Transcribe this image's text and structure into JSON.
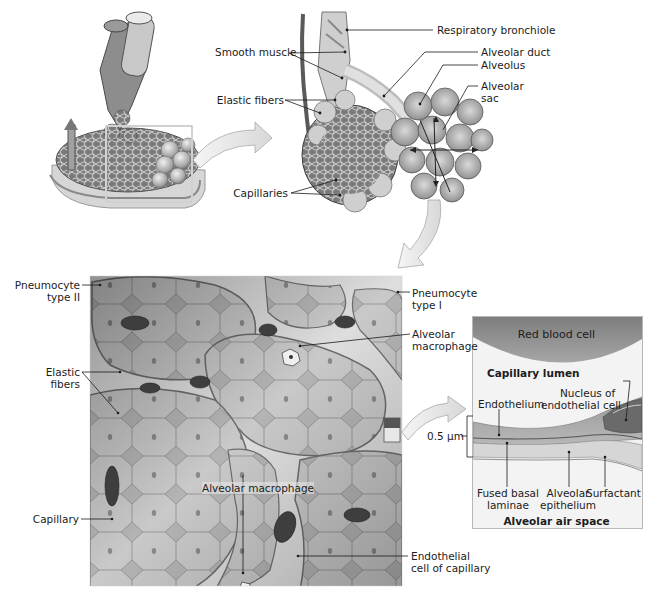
{
  "figure": {
    "topLeft": {
      "name": "lung-lobule-overview",
      "highlightBox": true
    },
    "topRight": {
      "labels": {
        "respiratory_bronchiole": "Respiratory bronchiole",
        "smooth_muscle": "Smooth muscle",
        "alveolar_duct": "Alveolar duct",
        "alveolus": "Alveolus",
        "alveolar_sac_1": "Alveolar",
        "alveolar_sac_2": "sac",
        "elastic_fibers": "Elastic fibers",
        "capillaries": "Capillaries"
      }
    },
    "bottomLeft": {
      "labels": {
        "pneumocyte_ii_1": "Pneumocyte",
        "pneumocyte_ii_2": "type II",
        "pneumocyte_i_1": "Pneumocyte",
        "pneumocyte_i_2": "type I",
        "alveolar_macrophage_1": "Alveolar",
        "alveolar_macrophage_2": "macrophage",
        "elastic_fibers_1": "Elastic",
        "elastic_fibers_2": "fibers",
        "capillary": "Capillary",
        "alveolar_macrophage_inner": "Alveolar macrophage",
        "endothelial_cell_1": "Endothelial",
        "endothelial_cell_2": "cell of capillary"
      }
    },
    "rightPanel": {
      "labels": {
        "red_blood_cell": "Red blood cell",
        "capillary_lumen": "Capillary lumen",
        "nucleus_1": "Nucleus of",
        "nucleus_2": "endothelial cell",
        "endothelium": "Endothelium",
        "scale": "0.5 μm",
        "fused_basal_1": "Fused basal",
        "fused_basal_2": "laminae",
        "alveolar_epi_1": "Alveolar",
        "alveolar_epi_2": "epithelium",
        "surfactant": "Surfactant",
        "air_space": "Alveolar air space"
      }
    },
    "colors": {
      "rbc": "#8e8e8e",
      "lumen": "#f2f2f2",
      "endothelium": "#a9a9a9",
      "epithelium": "#d2d2d2",
      "arrow": "#e6e6e6",
      "line": "#1a1a1a"
    }
  }
}
